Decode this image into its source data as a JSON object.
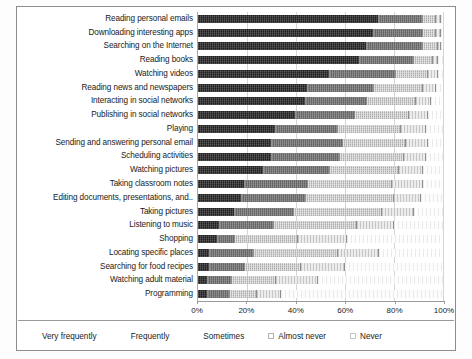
{
  "chart_data": {
    "type": "bar",
    "subtype": "stacked-horizontal-100-percent",
    "title": "",
    "xlabel": "",
    "ylabel": "",
    "xlim": [
      0,
      100
    ],
    "xticks": [
      "0%",
      "20%",
      "40%",
      "60%",
      "80%",
      "100%"
    ],
    "xtick_values": [
      0,
      20,
      40,
      60,
      80,
      100
    ],
    "grid": true,
    "legend_position": "bottom",
    "legend": [
      "Very frequently",
      "Frequently",
      "Sometimes",
      "Almost never",
      "Never"
    ],
    "categories": [
      "Reading personal emails",
      "Downloading interesting apps",
      "Searching on the Internet",
      "Reading books",
      "Watching videos",
      "Reading news and newspapers",
      "Interacting in social networks",
      "Publishing in social networks",
      "Playing",
      "Sending and answering personal email",
      "Scheduling activities",
      "Watching pictures",
      "Taking classroom notes",
      "Editing documents, presentations, and..",
      "Taking pictures",
      "Listening to music",
      "Shopping",
      "Locating specific places",
      "Searching for food recipes",
      "Watching adult material",
      "Programming"
    ],
    "series": [
      {
        "name": "Very frequently",
        "values": [
          74,
          72,
          69,
          66,
          54,
          45,
          44,
          40,
          32,
          30,
          30,
          27,
          19,
          18,
          15,
          9,
          8,
          5,
          5,
          4,
          4
        ]
      },
      {
        "name": "Frequently",
        "values": [
          18,
          20,
          23,
          22,
          27,
          27,
          25,
          24,
          25,
          29,
          28,
          27,
          26,
          26,
          24,
          22,
          7,
          18,
          14,
          10,
          9
        ]
      },
      {
        "name": "Sometimes",
        "values": [
          5,
          5,
          6,
          8,
          13,
          20,
          20,
          22,
          26,
          26,
          26,
          28,
          34,
          36,
          36,
          34,
          26,
          34,
          23,
          18,
          11
        ]
      },
      {
        "name": "Almost never",
        "values": [
          2,
          2,
          1,
          2,
          4,
          5,
          6,
          8,
          10,
          9,
          9,
          10,
          13,
          11,
          13,
          15,
          20,
          17,
          18,
          17,
          10
        ]
      },
      {
        "name": "Never",
        "values": [
          1,
          1,
          1,
          2,
          2,
          3,
          5,
          6,
          7,
          6,
          7,
          8,
          8,
          9,
          12,
          20,
          39,
          26,
          40,
          51,
          66
        ]
      }
    ]
  }
}
